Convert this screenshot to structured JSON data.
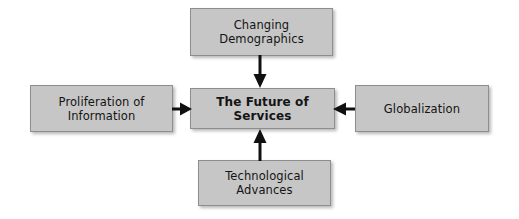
{
  "diagram": {
    "title": "The Future of Services",
    "center": {
      "label": "The Future of Services",
      "name": "center-node"
    },
    "nodes": [
      {
        "id": "top",
        "label": "Changing\nDemographics",
        "position": "top",
        "arrow": "arrow-down-icon"
      },
      {
        "id": "left",
        "label": "Proliferation of\nInformation",
        "position": "left",
        "arrow": "arrow-right-icon"
      },
      {
        "id": "right",
        "label": "Globalization",
        "position": "right",
        "arrow": "arrow-left-icon"
      },
      {
        "id": "bottom",
        "label": "Technological\nAdvances",
        "position": "bottom",
        "arrow": "arrow-up-icon"
      }
    ],
    "colors": {
      "box_fill": "#c6c6c6",
      "box_border": "#8e8e8e",
      "text": "#141414",
      "arrow": "#101010",
      "background": "#ffffff"
    }
  }
}
